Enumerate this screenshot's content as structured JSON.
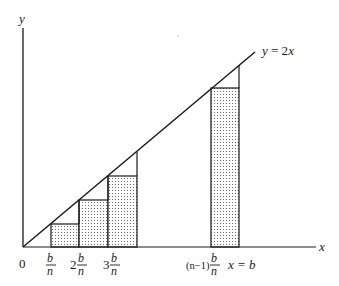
{
  "diagram": {
    "title": "",
    "axes": {
      "x_label": "x",
      "y_label": "y",
      "origin_label": "0"
    },
    "line": {
      "label": "y = 2x",
      "label_parts": {
        "lhs": "y",
        "eq": " = 2",
        "var": "x"
      }
    },
    "ticks": [
      {
        "coef": "",
        "num": "b",
        "den": "n"
      },
      {
        "coef": "2",
        "num": "b",
        "den": "n"
      },
      {
        "coef": "3",
        "num": "b",
        "den": "n"
      },
      {
        "coef": "(n−1)",
        "num": "b",
        "den": "n"
      }
    ],
    "end_label": "x = b",
    "colors": {
      "stroke": "#1a1a1a",
      "fill_dots": "#555555",
      "background": "#ffffff"
    },
    "rectangles": [
      {
        "name": "rect-1",
        "x_from": "b/n",
        "x_to": "2b/n"
      },
      {
        "name": "rect-2",
        "x_from": "2b/n",
        "x_to": "3b/n"
      },
      {
        "name": "rect-3",
        "x_from": "3b/n",
        "x_to": "4b/n"
      },
      {
        "name": "rect-last",
        "x_from": "(n-1)b/n",
        "x_to": "b"
      }
    ]
  }
}
